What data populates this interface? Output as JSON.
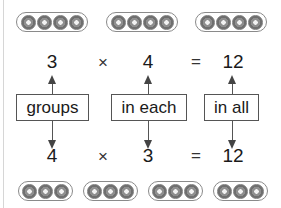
{
  "top_row": {
    "groups": 3,
    "beads_per_group": 4
  },
  "equation_top": {
    "factor1": "3",
    "operator": "×",
    "factor2": "4",
    "equals": "=",
    "product": "12"
  },
  "labels": {
    "groups": "groups",
    "in_each": "in each",
    "in_all": "in all"
  },
  "equation_bottom": {
    "factor1": "4",
    "operator": "×",
    "factor2": "3",
    "equals": "=",
    "product": "12"
  },
  "bottom_row": {
    "groups": 4,
    "beads_per_group": 3
  },
  "colors": {
    "bead": "#8e8e8e",
    "outline": "#8a8a8a",
    "text": "#1a1a1a"
  }
}
